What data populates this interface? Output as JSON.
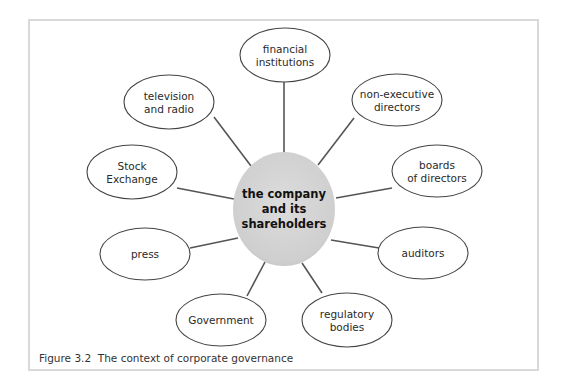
{
  "figure": {
    "caption": "Figure 3.2  The context of corporate governance",
    "center": {
      "lines": [
        "the company",
        "and its",
        "shareholders"
      ],
      "cx": 284,
      "cy": 209,
      "rx": 51,
      "ry": 57,
      "fill": "#d3d3d3"
    },
    "nodes": [
      {
        "id": "financial-institutions",
        "lines": [
          "financial",
          "institutions"
        ],
        "cx": 285,
        "cy": 55,
        "rx": 45,
        "ry": 27,
        "ax": 284,
        "ay": 82,
        "bx": 284,
        "by": 152
      },
      {
        "id": "non-executive-directors",
        "lines": [
          "non-executive",
          "directors"
        ],
        "cx": 397,
        "cy": 100,
        "rx": 45,
        "ry": 26,
        "ax": 354,
        "ay": 118,
        "bx": 318,
        "by": 165
      },
      {
        "id": "boards-of-directors",
        "lines": [
          "boards",
          "of directors"
        ],
        "cx": 437,
        "cy": 171,
        "rx": 45,
        "ry": 26,
        "ax": 392,
        "ay": 188,
        "bx": 336,
        "by": 198
      },
      {
        "id": "auditors",
        "lines": [
          "auditors"
        ],
        "cx": 423,
        "cy": 253,
        "rx": 45,
        "ry": 26,
        "ax": 379,
        "ay": 248,
        "bx": 331,
        "by": 240
      },
      {
        "id": "regulatory-bodies",
        "lines": [
          "regulatory",
          "bodies"
        ],
        "cx": 347,
        "cy": 320,
        "rx": 45,
        "ry": 27,
        "ax": 322,
        "ay": 293,
        "bx": 302,
        "by": 263
      },
      {
        "id": "government",
        "lines": [
          "Government"
        ],
        "cx": 221,
        "cy": 320,
        "rx": 45,
        "ry": 26,
        "ax": 247,
        "ay": 296,
        "bx": 265,
        "by": 262
      },
      {
        "id": "press",
        "lines": [
          "press"
        ],
        "cx": 145,
        "cy": 254,
        "rx": 45,
        "ry": 26,
        "ax": 190,
        "ay": 248,
        "bx": 238,
        "by": 238
      },
      {
        "id": "stock-exchange",
        "lines": [
          "Stock",
          "Exchange"
        ],
        "cx": 132,
        "cy": 172,
        "rx": 45,
        "ry": 27,
        "ax": 177,
        "ay": 188,
        "bx": 234,
        "by": 199
      },
      {
        "id": "television-and-radio",
        "lines": [
          "television",
          "and radio"
        ],
        "cx": 169,
        "cy": 102,
        "rx": 45,
        "ry": 27,
        "ax": 214,
        "ay": 117,
        "bx": 251,
        "by": 166
      }
    ],
    "colors": {
      "line": "#555555",
      "ellipse_stroke": "#444444",
      "frame": "#d9d9d9"
    }
  }
}
